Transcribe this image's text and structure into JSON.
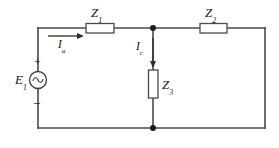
{
  "figure": {
    "type": "electrical-circuit-schematic",
    "background_color": "#ffffff",
    "wire_color": "#4a4a4a",
    "label_color": "#111111"
  },
  "source": {
    "name": "voltage-source",
    "label": "E",
    "subscript": "1",
    "symbol": "~",
    "symbol_name": "ac-sine-source",
    "plus_sign": "+",
    "minus_sign": "–",
    "center_x": 38,
    "center_y": 80,
    "radius": 8.5
  },
  "components": [
    {
      "name": "impedance-z1",
      "label": "Z",
      "subscript": "1",
      "orientation": "horizontal",
      "x": 86,
      "y": 24,
      "width": 28,
      "height": 9.5
    },
    {
      "name": "impedance-z2",
      "label": "Z",
      "subscript": "2",
      "orientation": "horizontal",
      "x": 200,
      "y": 24,
      "width": 27,
      "height": 9.5
    },
    {
      "name": "impedance-z3",
      "label": "Z",
      "subscript": "3",
      "orientation": "vertical",
      "x": 149,
      "y": 70,
      "width": 9.5,
      "height": 28
    }
  ],
  "currents": [
    {
      "name": "current-ia",
      "label": "I",
      "subscript": "a",
      "direction": "right",
      "arrow_from_x": 48,
      "arrow_to_x": 84,
      "arrow_y": 36
    },
    {
      "name": "current-ic",
      "label": "I",
      "subscript": "c",
      "direction": "down",
      "arrow_x": 153,
      "arrow_from_y": 38,
      "arrow_to_y": 68
    }
  ],
  "nodes": [
    {
      "name": "node-top-junction",
      "x": 153,
      "y": 28,
      "radius": 3
    },
    {
      "name": "node-bottom-junction",
      "x": 153,
      "y": 128,
      "radius": 3
    }
  ],
  "frame": {
    "left_x": 38,
    "right_x": 265,
    "top_y": 28,
    "bottom_y": 128
  }
}
